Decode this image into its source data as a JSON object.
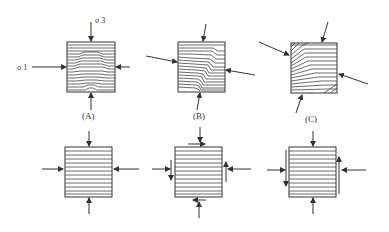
{
  "figure": {
    "panels": [
      {
        "id": "A",
        "label": "(A)",
        "description": "Horizontal layers folded under vertical sigma3 and horizontal sigma1 compression; symmetric fold"
      },
      {
        "id": "B",
        "label": "(B)",
        "description": "Layers under oblique compression; asymmetric fold with shear"
      },
      {
        "id": "C",
        "label": "(C)",
        "description": "Layers under strongly oblique compression; kink-like inclined layers"
      }
    ],
    "stress_labels": {
      "sigma3": "σ 3",
      "sigma1": "σ 1"
    },
    "colors": {
      "line": "#333333",
      "background": "#ffffff"
    }
  }
}
